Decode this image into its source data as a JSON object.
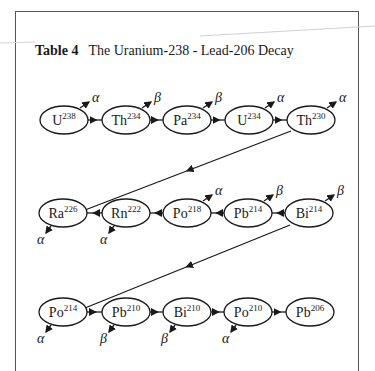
{
  "title": {
    "label": "Table 4",
    "text": "The Uranium-238 - Lead-206 Decay"
  },
  "rows": [
    {
      "y": 120,
      "connector_dir": "right",
      "nodes": [
        {
          "el": "U",
          "mass": "238",
          "x": 64,
          "emission": "α",
          "emit_pos": "up"
        },
        {
          "el": "Th",
          "mass": "234",
          "x": 126,
          "emission": "β",
          "emit_pos": "up"
        },
        {
          "el": "Pa",
          "mass": "234",
          "x": 187,
          "emission": "β",
          "emit_pos": "up"
        },
        {
          "el": "U",
          "mass": "234",
          "x": 249,
          "emission": "α",
          "emit_pos": "up"
        },
        {
          "el": "Th",
          "mass": "230",
          "x": 311,
          "emission": "α",
          "emit_pos": "up"
        }
      ]
    },
    {
      "y": 213,
      "connector_dir": "left",
      "nodes": [
        {
          "el": "Ra",
          "mass": "226",
          "x": 63,
          "emission": "α",
          "emit_pos": "down"
        },
        {
          "el": "Rn",
          "mass": "222",
          "x": 126,
          "emission": "α",
          "emit_pos": "down"
        },
        {
          "el": "Po",
          "mass": "218",
          "x": 187,
          "emission": "α",
          "emit_pos": "up"
        },
        {
          "el": "Pb",
          "mass": "214",
          "x": 248,
          "emission": "β",
          "emit_pos": "up"
        },
        {
          "el": "Bi",
          "mass": "214",
          "x": 309,
          "emission": "β",
          "emit_pos": "up"
        }
      ]
    },
    {
      "y": 312,
      "connector_dir": "right",
      "nodes": [
        {
          "el": "Po",
          "mass": "214",
          "x": 63,
          "emission": "α",
          "emit_pos": "down"
        },
        {
          "el": "Pb",
          "mass": "210",
          "x": 126,
          "emission": "β",
          "emit_pos": "down"
        },
        {
          "el": "Bi",
          "mass": "210",
          "x": 187,
          "emission": "β",
          "emit_pos": "down"
        },
        {
          "el": "Po",
          "mass": "210",
          "x": 248,
          "emission": "α",
          "emit_pos": "down"
        },
        {
          "el": "Pb",
          "mass": "206",
          "x": 310,
          "emission": "",
          "emit_pos": "none"
        }
      ]
    }
  ],
  "row_links": [
    {
      "from": "Th230",
      "to": "Ra226",
      "x1": 291,
      "y1": 131,
      "x2": 85,
      "y2": 210
    },
    {
      "from": "Bi214",
      "to": "Po214",
      "x1": 290,
      "y1": 225,
      "x2": 85,
      "y2": 308
    }
  ],
  "colors": {
    "ink": "#1a1a1a",
    "frame": "#555555",
    "background": "#ffffff"
  }
}
